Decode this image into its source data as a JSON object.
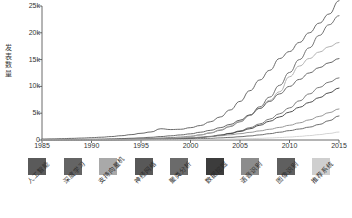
{
  "chart_data": {
    "type": "line",
    "title": "",
    "xlabel": "",
    "ylabel": "发表数量",
    "xlim": [
      1985,
      2015
    ],
    "ylim": [
      0,
      25000
    ],
    "grid": false,
    "legend_position": "bottom",
    "x_ticks": [
      "1985",
      "1990",
      "1995",
      "2000",
      "2005",
      "2010",
      "2015"
    ],
    "y_ticks": [
      "0",
      "5k",
      "10k",
      "15k",
      "20k",
      "25k"
    ],
    "x": [
      1985,
      1986,
      1987,
      1988,
      1989,
      1990,
      1991,
      1992,
      1993,
      1994,
      1995,
      1996,
      1997,
      1998,
      1999,
      2000,
      2001,
      2002,
      2003,
      2004,
      2005,
      2006,
      2007,
      2008,
      2009,
      2010,
      2011,
      2012,
      2013,
      2014,
      2015
    ],
    "series": [
      {
        "name": "人工智能",
        "color": "#5a5a5a",
        "values": [
          180,
          210,
          250,
          300,
          360,
          430,
          520,
          640,
          800,
          1000,
          1250,
          1500,
          2100,
          1950,
          2000,
          2300,
          2700,
          3400,
          4300,
          5600,
          7200,
          9200,
          11200,
          13000,
          15200,
          16500,
          18200,
          20000,
          21800,
          23500,
          26000
        ]
      },
      {
        "name": "深度学习",
        "color": "#646464",
        "values": [
          40,
          45,
          52,
          60,
          70,
          82,
          96,
          115,
          140,
          175,
          220,
          280,
          360,
          440,
          540,
          700,
          950,
          1300,
          1800,
          2500,
          3400,
          4600,
          6200,
          8000,
          10200,
          12600,
          15000,
          17200,
          19500,
          21500,
          23200
        ]
      },
      {
        "name": "支持向量机",
        "color": "#a9a9a9",
        "values": [
          20,
          22,
          25,
          28,
          33,
          38,
          45,
          55,
          70,
          90,
          120,
          160,
          230,
          320,
          450,
          650,
          950,
          1350,
          1900,
          2600,
          3500,
          4600,
          5900,
          7400,
          9000,
          11800,
          13800,
          15200,
          16400,
          17400,
          18200
        ]
      },
      {
        "name": "神经网络",
        "color": "#585858",
        "values": [
          60,
          70,
          82,
          98,
          118,
          142,
          172,
          210,
          260,
          320,
          400,
          500,
          640,
          780,
          950,
          1150,
          1450,
          1800,
          2300,
          2900,
          3700,
          4700,
          5900,
          7200,
          8600,
          10000,
          11300,
          12500,
          13500,
          14400,
          15200
        ]
      },
      {
        "name": "聚类分析",
        "color": "#6b6b6b",
        "values": [
          15,
          17,
          20,
          23,
          27,
          32,
          38,
          46,
          58,
          74,
          95,
          125,
          165,
          215,
          280,
          370,
          500,
          680,
          920,
          1250,
          1700,
          2300,
          3000,
          3900,
          4900,
          6000,
          7300,
          8600,
          9800,
          10800,
          11600
        ]
      },
      {
        "name": "数据挖掘",
        "color": "#3c3c3c",
        "values": [
          10,
          11,
          13,
          15,
          18,
          22,
          27,
          34,
          43,
          55,
          72,
          95,
          128,
          175,
          240,
          330,
          460,
          640,
          880,
          1200,
          1600,
          2100,
          2750,
          3500,
          4300,
          5200,
          6100,
          7000,
          7900,
          8800,
          9700
        ]
      },
      {
        "name": "语音识别",
        "color": "#8c8c8c",
        "values": [
          25,
          28,
          32,
          37,
          44,
          52,
          62,
          75,
          92,
          113,
          140,
          175,
          220,
          275,
          340,
          420,
          520,
          640,
          790,
          970,
          1180,
          1420,
          1700,
          2000,
          2350,
          2750,
          3200,
          3750,
          4400,
          5100,
          5800
        ]
      },
      {
        "name": "图像识别",
        "color": "#5f5f5f",
        "values": [
          12,
          13,
          15,
          17,
          20,
          24,
          29,
          35,
          43,
          53,
          66,
          82,
          102,
          128,
          160,
          200,
          250,
          310,
          390,
          490,
          610,
          760,
          950,
          1180,
          1450,
          1750,
          2050,
          2400,
          2900,
          3600,
          4500
        ]
      },
      {
        "name": "推荐系统",
        "color": "#cfcfcf",
        "values": [
          5,
          6,
          7,
          8,
          9,
          11,
          13,
          16,
          19,
          23,
          28,
          34,
          42,
          51,
          62,
          76,
          93,
          113,
          138,
          168,
          205,
          250,
          305,
          372,
          454,
          553,
          674,
          822,
          1002,
          1222,
          1490
        ]
      }
    ]
  },
  "legend": {
    "items": [
      {
        "label": "人工智能",
        "color": "#5a5a5a"
      },
      {
        "label": "深度学习",
        "color": "#646464"
      },
      {
        "label": "支持向量机",
        "color": "#a9a9a9"
      },
      {
        "label": "神经网络",
        "color": "#585858"
      },
      {
        "label": "聚类分析",
        "color": "#6b6b6b"
      },
      {
        "label": "数据挖掘",
        "color": "#3c3c3c"
      },
      {
        "label": "语音识别",
        "color": "#8c8c8c"
      },
      {
        "label": "图像识别",
        "color": "#5f5f5f"
      },
      {
        "label": "推荐系统",
        "color": "#cfcfcf"
      }
    ]
  }
}
